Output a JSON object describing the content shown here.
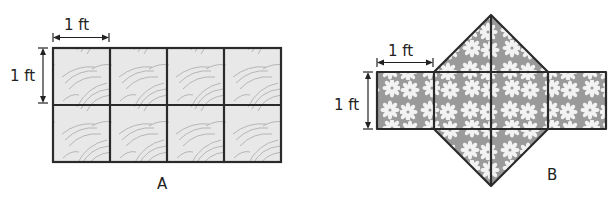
{
  "figure_a": {
    "label": "A",
    "width_label": "1 ft",
    "height_label": "1 ft",
    "rows": 2,
    "cols": 4,
    "tile_fill": "#e6e6e6",
    "stroke_color": "#2a2a2a"
  },
  "figure_b": {
    "label": "B",
    "width_label": "1 ft",
    "height_label": "1 ft",
    "squares": 4,
    "triangles": 4,
    "tile_fill": "#9a9a9a",
    "flower_color": "#f2f2f2",
    "stroke_color": "#2a2a2a"
  }
}
